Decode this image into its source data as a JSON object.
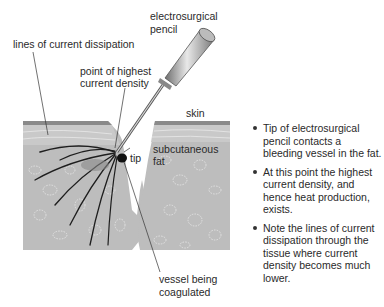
{
  "diagram": {
    "labels": {
      "pencil_line1": "electrosurgical",
      "pencil_line2": "pencil",
      "dissipation": "lines of current dissipation",
      "highest_line1": "point of highest",
      "highest_line2": "current density",
      "skin": "skin",
      "fat_line1": "subcutaneous",
      "fat_line2": "fat",
      "tip": "tip",
      "vessel_line1": "vessel being",
      "vessel_line2": "coagulated"
    },
    "colors": {
      "skin": "#8a8a8a",
      "dermis": "#c4c4c4",
      "fat": "#bdbdbd",
      "fat_cells": "#e4e4e4",
      "current_lines": "#1e1e1e",
      "pencil": "#9a9a9a"
    }
  },
  "notes": {
    "bullets": [
      "Tip of electrosurgical pencil contacts a bleeding vessel in the fat.",
      "At this point the highest current density, and hence heat production, exists.",
      "Note the lines of current dissipation through the tissue where current density becomes much lower."
    ]
  }
}
